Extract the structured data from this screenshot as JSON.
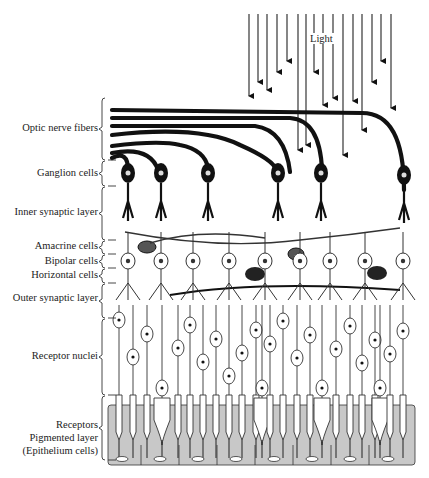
{
  "light_label": "Light",
  "layers": [
    {
      "id": "optic-nerve-fibers",
      "label": "Optic nerve fibers",
      "y": 128,
      "bracket": [
        98,
        160
      ]
    },
    {
      "id": "ganglion-cells",
      "label": "Ganglion cells",
      "y": 173,
      "bracket": [
        161,
        186
      ]
    },
    {
      "id": "inner-synaptic-layer",
      "label": "Inner synaptic layer",
      "y": 212,
      "bracket": [
        187,
        240
      ]
    },
    {
      "id": "amacrine-cells",
      "label": "Amacrine cells",
      "y": 246,
      "bracket": [
        241,
        254
      ]
    },
    {
      "id": "bipolar-cells",
      "label": "Bipolar cells",
      "y": 261,
      "bracket": [
        255,
        268
      ]
    },
    {
      "id": "horizontal-cells",
      "label": "Horizontal cells",
      "y": 275,
      "bracket": [
        269,
        283
      ]
    },
    {
      "id": "outer-synaptic-layer",
      "label": "Outer synaptic layer",
      "y": 298,
      "bracket": [
        284,
        318
      ]
    },
    {
      "id": "receptor-nuclei",
      "label": "Receptor nuclei",
      "y": 356,
      "bracket": [
        319,
        395
      ]
    },
    {
      "id": "receptors",
      "label": "Receptors",
      "y": 425,
      "bracket": [
        396,
        460
      ]
    },
    {
      "id": "pigmented-layer",
      "label": "Pigmented layer",
      "y": 438,
      "bracket": null
    },
    {
      "id": "epithelium-cells",
      "label": "(Epithelium cells)",
      "y": 451,
      "bracket": null
    }
  ],
  "colors": {
    "ink": "#111111",
    "pigment": "#c8c8c8",
    "background": "#ffffff",
    "label": "#222222"
  }
}
